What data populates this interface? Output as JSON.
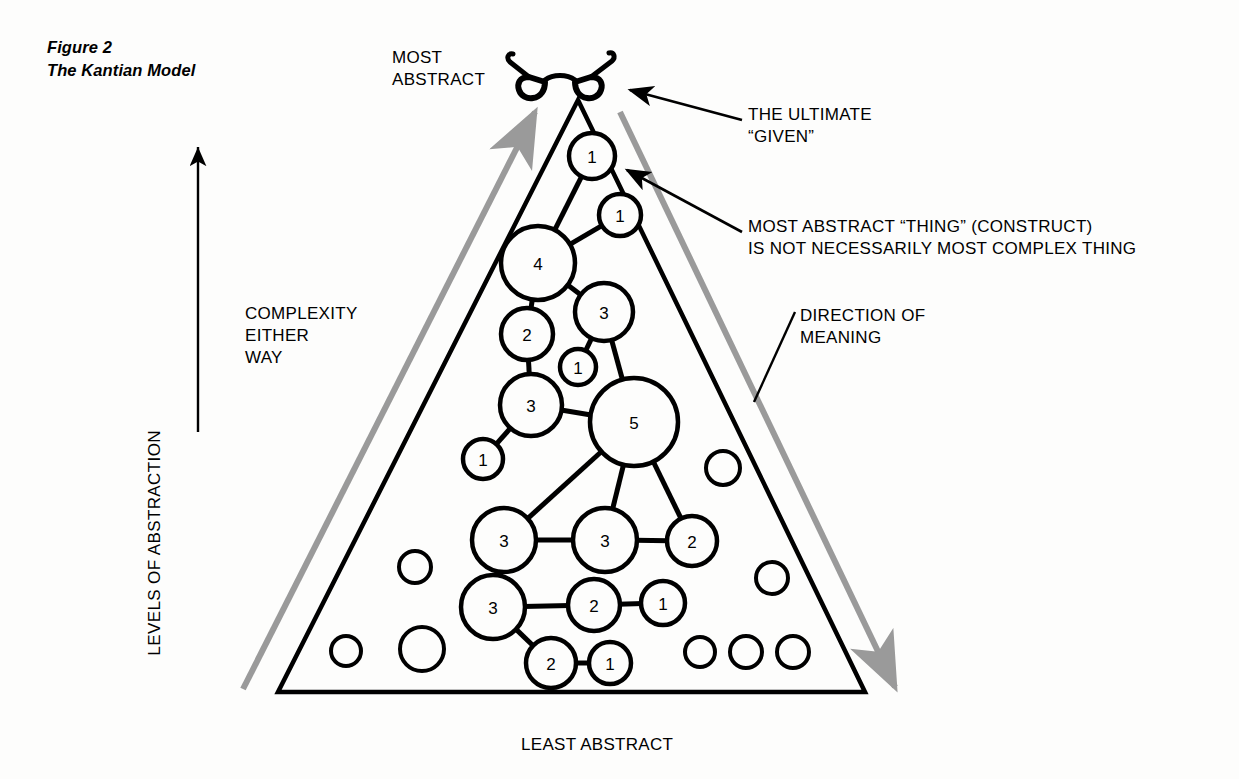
{
  "figure": {
    "caption_lines": [
      "Figure 2",
      "The Kantian Model"
    ]
  },
  "labels": {
    "most_abstract": "MOST\nABSTRACT",
    "least_abstract": "LEAST ABSTRACT",
    "levels_of_abstraction": "LEVELS OF ABSTRACTION",
    "complexity_either_way": "COMPLEXITY\nEITHER\nWAY",
    "direction_of_meaning": "DIRECTION OF\nMEANING",
    "ultimate_given": "THE ULTIMATE\n“GIVEN”",
    "most_abstract_thing": "MOST ABSTRACT “THING” (CONSTRUCT)\nIS NOT NECESSARILY MOST COMPLEX THING"
  },
  "icons": {
    "eyeglasses": "eyeglasses-icon",
    "up_arrow": "up-arrow-icon"
  },
  "colors": {
    "ink": "#000000",
    "gray_arrow": "#9a9a9a",
    "paper": "#fdfdfc"
  },
  "diagram": {
    "type": "node-network-in-triangle",
    "triangle": {
      "apex": [
        578,
        100
      ],
      "base_left": [
        278,
        692
      ],
      "base_right": [
        865,
        692
      ]
    },
    "nodes": [
      {
        "id": "n1",
        "label": "1",
        "cx": 592,
        "cy": 156,
        "r": 23
      },
      {
        "id": "n2",
        "label": "1",
        "cx": 620,
        "cy": 215,
        "r": 21
      },
      {
        "id": "n3",
        "label": "4",
        "cx": 538,
        "cy": 263,
        "r": 37
      },
      {
        "id": "n4",
        "label": "3",
        "cx": 604,
        "cy": 312,
        "r": 29
      },
      {
        "id": "n5",
        "label": "2",
        "cx": 527,
        "cy": 334,
        "r": 26
      },
      {
        "id": "n6",
        "label": "1",
        "cx": 578,
        "cy": 367,
        "r": 18
      },
      {
        "id": "n7",
        "label": "3",
        "cx": 531,
        "cy": 405,
        "r": 31
      },
      {
        "id": "n8",
        "label": "1",
        "cx": 483,
        "cy": 459,
        "r": 20
      },
      {
        "id": "n9",
        "label": "5",
        "cx": 634,
        "cy": 422,
        "r": 44
      },
      {
        "id": "n10",
        "label": "3",
        "cx": 504,
        "cy": 540,
        "r": 32
      },
      {
        "id": "n11",
        "label": "3",
        "cx": 605,
        "cy": 540,
        "r": 32
      },
      {
        "id": "n12",
        "label": "2",
        "cx": 692,
        "cy": 541,
        "r": 25
      },
      {
        "id": "n13",
        "label": "3",
        "cx": 493,
        "cy": 607,
        "r": 32
      },
      {
        "id": "n14",
        "label": "2",
        "cx": 594,
        "cy": 605,
        "r": 26
      },
      {
        "id": "n15",
        "label": "1",
        "cx": 663,
        "cy": 603,
        "r": 22
      },
      {
        "id": "n16",
        "label": "2",
        "cx": 551,
        "cy": 663,
        "r": 25
      },
      {
        "id": "n17",
        "label": "1",
        "cx": 610,
        "cy": 663,
        "r": 21
      }
    ],
    "edges": [
      [
        "n1",
        "n3"
      ],
      [
        "n2",
        "n3"
      ],
      [
        "n3",
        "n4"
      ],
      [
        "n3",
        "n5"
      ],
      [
        "n4",
        "n6"
      ],
      [
        "n4",
        "n9"
      ],
      [
        "n5",
        "n7"
      ],
      [
        "n7",
        "n8"
      ],
      [
        "n7",
        "n9"
      ],
      [
        "n9",
        "n10"
      ],
      [
        "n9",
        "n11"
      ],
      [
        "n9",
        "n12"
      ],
      [
        "n10",
        "n11"
      ],
      [
        "n11",
        "n12"
      ],
      [
        "n10",
        "n13"
      ],
      [
        "n13",
        "n14"
      ],
      [
        "n14",
        "n15"
      ],
      [
        "n13",
        "n16"
      ],
      [
        "n16",
        "n17"
      ]
    ],
    "empty_nodes": [
      {
        "cx": 723,
        "cy": 468,
        "r": 17
      },
      {
        "cx": 415,
        "cy": 567,
        "r": 16
      },
      {
        "cx": 772,
        "cy": 578,
        "r": 16
      },
      {
        "cx": 346,
        "cy": 651,
        "r": 15
      },
      {
        "cx": 422,
        "cy": 649,
        "r": 22
      },
      {
        "cx": 700,
        "cy": 652,
        "r": 15
      },
      {
        "cx": 746,
        "cy": 652,
        "r": 16
      },
      {
        "cx": 793,
        "cy": 652,
        "r": 16
      }
    ],
    "annotation_leaders": [
      {
        "name": "ultimate-given-leader",
        "from": [
          740,
          118
        ],
        "to": [
          628,
          90
        ]
      },
      {
        "name": "most-abstract-thing-leader",
        "from": [
          740,
          230
        ],
        "to": [
          625,
          168
        ]
      },
      {
        "name": "direction-of-meaning-leader",
        "from": [
          795,
          310
        ],
        "to": [
          752,
          400
        ]
      }
    ]
  }
}
